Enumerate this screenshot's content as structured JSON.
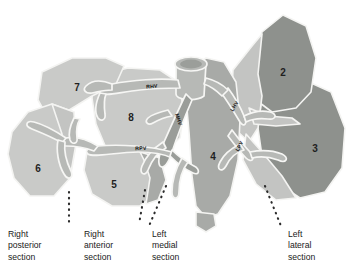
{
  "figure": {
    "name": "liver-segmental-anatomy-diagram"
  },
  "colors": {
    "background": "#ffffff",
    "light_gray": "#c9cac8",
    "light_gray_2": "#c4c5c3",
    "mid_gray": "#a8aaa7",
    "dark_gray": "#8e918d",
    "vessel_gray": "#b4b6b3",
    "vessel_dark": "#9a9d99",
    "outline": "#f2f2f0",
    "text": "#1a1a1a",
    "dot_leader": "#2b2b2b"
  },
  "segments": [
    {
      "id": "segment-2",
      "label": "2",
      "x": 283,
      "y": 76,
      "shade": "dark"
    },
    {
      "id": "segment-3",
      "label": "3",
      "x": 315,
      "y": 152,
      "shade": "dark"
    },
    {
      "id": "segment-4",
      "label": "4",
      "x": 213,
      "y": 160,
      "shade": "mid"
    },
    {
      "id": "segment-5",
      "label": "5",
      "x": 114,
      "y": 188,
      "shade": "light"
    },
    {
      "id": "segment-6",
      "label": "6",
      "x": 38,
      "y": 172,
      "shade": "light"
    },
    {
      "id": "segment-7",
      "label": "7",
      "x": 77,
      "y": 91,
      "shade": "light"
    },
    {
      "id": "segment-8",
      "label": "8",
      "x": 131,
      "y": 121,
      "shade": "light"
    }
  ],
  "vessel_labels": [
    {
      "id": "rhv-label",
      "text": "RHV",
      "name": "right-hepatic-vein-label",
      "x": 152,
      "y": 88,
      "rotate": -4
    },
    {
      "id": "mhv-label",
      "text": "MHV",
      "name": "middle-hepatic-vein-label",
      "x": 177,
      "y": 120,
      "rotate": 72
    },
    {
      "id": "rpv-label",
      "text": "RPV",
      "name": "right-portal-vein-label",
      "x": 141,
      "y": 150,
      "rotate": -3
    },
    {
      "id": "lhv-label",
      "text": "LHV",
      "name": "left-hepatic-vein-label",
      "x": 236,
      "y": 107,
      "rotate": -58
    },
    {
      "id": "lpv-label",
      "text": "LPV",
      "name": "left-portal-vein-label",
      "x": 241,
      "y": 147,
      "rotate": -62
    }
  ],
  "captions": [
    {
      "id": "caption-right-posterior",
      "name": "caption-right-posterior-section",
      "text": "Right\nposterior\nsection",
      "x": 8,
      "y": 229
    },
    {
      "id": "caption-right-anterior",
      "name": "caption-right-anterior-section",
      "text": "Right\nanterior\nsection",
      "x": 84,
      "y": 229
    },
    {
      "id": "caption-left-medial",
      "name": "caption-left-medial-section",
      "text": "Left\nmedial\nsection",
      "x": 152,
      "y": 229
    },
    {
      "id": "caption-left-lateral",
      "name": "caption-left-lateral-section",
      "text": "Left\nlateral\nsection",
      "x": 288,
      "y": 229
    }
  ],
  "leaders": [
    {
      "id": "leader-right-posterior",
      "name": "leader-line-right-posterior",
      "x1": 69,
      "y1": 192,
      "x2": 69,
      "y2": 224
    },
    {
      "id": "leader-right-anterior",
      "name": "leader-line-right-anterior",
      "x1": 145,
      "y1": 190,
      "x2": 139,
      "y2": 224
    },
    {
      "id": "leader-left-medial",
      "name": "leader-line-left-medial",
      "x1": 163,
      "y1": 188,
      "x2": 149,
      "y2": 226
    },
    {
      "id": "leader-left-lateral",
      "name": "leader-line-left-lateral",
      "x1": 266,
      "y1": 188,
      "x2": 281,
      "y2": 226
    }
  ]
}
